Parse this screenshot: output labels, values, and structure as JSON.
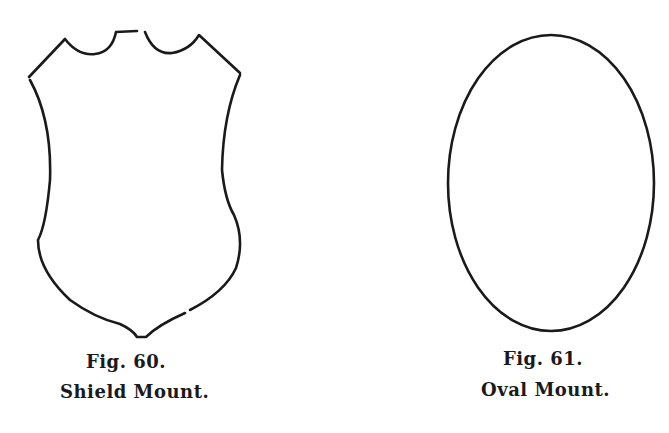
{
  "figures": [
    {
      "id": "fig60",
      "label": "Fig. 60.",
      "title": "Shield Mount.",
      "shape": "shield-outline"
    },
    {
      "id": "fig61",
      "label": "Fig. 61.",
      "title": "Oval Mount.",
      "shape": "oval-outline"
    }
  ],
  "colors": {
    "background": "#ffffff",
    "ink": "#1a1a1a"
  }
}
